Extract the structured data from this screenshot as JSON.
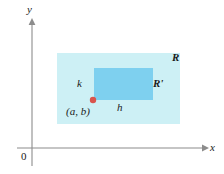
{
  "figure": {
    "width": 224,
    "height": 174,
    "background": "#ffffff"
  },
  "axes": {
    "x_label": "x",
    "y_label": "y",
    "origin_label": "0",
    "axis_color": "#8c8c8c",
    "x_axis": {
      "y": 148,
      "x_start": 17,
      "x_end": 205
    },
    "y_axis": {
      "x": 32,
      "y_start": 22,
      "y_end": 166
    }
  },
  "shapes": {
    "outer_rect": {
      "label": "R",
      "color": "#cdf0f5",
      "x": 57,
      "y": 53,
      "width": 123,
      "height": 71
    },
    "inner_rect": {
      "label": "R'",
      "color": "#7ed0ef",
      "x": 94,
      "y": 68,
      "width": 59,
      "height": 32
    },
    "point": {
      "label": "(a, b)",
      "color": "#d9544d",
      "cx": 93,
      "cy": 100,
      "r": 3.2
    }
  },
  "dimension_labels": {
    "height_label": "k",
    "width_label": "h"
  }
}
